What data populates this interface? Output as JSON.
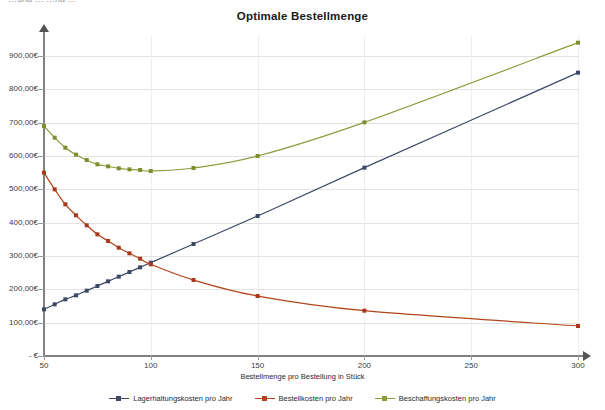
{
  "window": {
    "clipped_top_text": "…ung  …  …ng  …"
  },
  "chart_data": {
    "type": "line",
    "title": "Optimale Bestellmenge",
    "xlabel": "Bestellmenge pro Bestellung in Stück",
    "ylabel": "",
    "xlim": [
      50,
      310
    ],
    "ylim": [
      0,
      960
    ],
    "grid": true,
    "legend_position": "bottom",
    "x_ticks": [
      "50",
      "100",
      "150",
      "200",
      "250",
      "300"
    ],
    "x_tick_values": [
      50,
      100,
      150,
      200,
      250,
      300
    ],
    "y_ticks": [
      "- €",
      "100,00€",
      "200,00€",
      "300,00€",
      "400,00€",
      "500,00€",
      "600,00€",
      "700,00€",
      "800,00€",
      "900,00€"
    ],
    "y_tick_values": [
      0,
      100,
      200,
      300,
      400,
      500,
      600,
      700,
      800,
      900
    ],
    "x": [
      50,
      55,
      60,
      65,
      70,
      75,
      80,
      85,
      90,
      95,
      100,
      120,
      150,
      200,
      300
    ],
    "series": [
      {
        "name": "Lagerhaltungskosten pro Jahr",
        "color": "#3e4a66",
        "marker_color": "#3b4763",
        "values": [
          140,
          155,
          170,
          182,
          196,
          210,
          224,
          238,
          252,
          266,
          280,
          336,
          420,
          565,
          850
        ]
      },
      {
        "name": "Bestellkosten pro Jahr",
        "color": "#b3431a",
        "marker_color": "#a8391a",
        "values": [
          550,
          500,
          455,
          422,
          392,
          365,
          345,
          325,
          308,
          292,
          275,
          228,
          180,
          136,
          90
        ]
      },
      {
        "name": "Beschaffungskosten pro Jahr",
        "color": "#8d9b3c",
        "marker_color": "#7e8d2e",
        "values": [
          690,
          655,
          625,
          604,
          588,
          575,
          569,
          563,
          560,
          558,
          555,
          564,
          600,
          701,
          940
        ]
      }
    ]
  },
  "legend": {
    "items": [
      {
        "label": "Lagerhaltungskosten pro Jahr",
        "color": "#3e4a66"
      },
      {
        "label": "Bestellkosten pro Jahr",
        "color": "#b3431a"
      },
      {
        "label": "Beschaffungskosten pro Jahr",
        "color": "#8d9b3c"
      }
    ]
  }
}
